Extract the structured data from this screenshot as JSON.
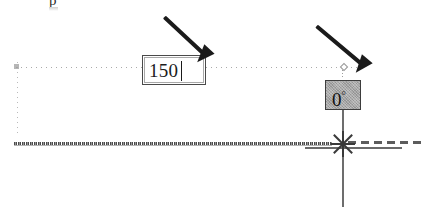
{
  "app": {
    "type": "cad-drafting-canvas",
    "background_color": "#ffffff"
  },
  "top_partial_text": "p",
  "dimension_input": {
    "name": "distance-dimension-input",
    "value": "150",
    "placeholder": "",
    "has_caret": true,
    "border_color": "#4a4a4a",
    "background_color": "#ffffff"
  },
  "angle_input": {
    "name": "angle-dimension-input",
    "value": "0",
    "unit": "°",
    "state": "selected",
    "background_color": "#a6a6a6",
    "border_color": "#3d3d3d"
  },
  "annotations": [
    {
      "name": "arrow-to-distance-input",
      "target": "distance-dimension-input",
      "direction": "down-left",
      "color": "#1b1b1b"
    },
    {
      "name": "arrow-to-angle-input",
      "target": "angle-dimension-input",
      "direction": "down-left",
      "color": "#1b1b1b"
    }
  ],
  "geometry": {
    "tracking_guide_horizontal": "dotted",
    "tracking_guide_vertical": "dotted",
    "object_line": "textured-solid",
    "dashed_extension": "dashed",
    "cursor_line": "vertical",
    "snap_marker": "intersection-snap"
  }
}
